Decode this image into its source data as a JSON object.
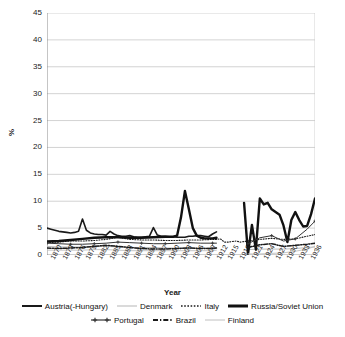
{
  "chart_data": {
    "type": "line",
    "title": "",
    "xlabel": "Year",
    "ylabel": "%",
    "ylim": [
      0,
      45
    ],
    "yticks": [
      0,
      5,
      10,
      15,
      20,
      25,
      30,
      35,
      40,
      45
    ],
    "xlim": [
      1870,
      1938
    ],
    "xticks": [
      1870,
      1873,
      1876,
      1879,
      1882,
      1885,
      1888,
      1891,
      1894,
      1897,
      1900,
      1903,
      1906,
      1909,
      1912,
      1915,
      1918,
      1921,
      1924,
      1927,
      1930,
      1933,
      1936
    ],
    "grid": "horizontal",
    "legend_position": "bottom",
    "series": [
      {
        "name": "Austria(-Hungary)",
        "style": "solid",
        "color": "#1a1a1a",
        "width": 1.6,
        "x": [
          1870,
          1871,
          1872,
          1873,
          1874,
          1875,
          1876,
          1877,
          1878,
          1879,
          1880,
          1881,
          1882,
          1883,
          1884,
          1885,
          1886,
          1887,
          1888,
          1889,
          1890,
          1891,
          1892,
          1893,
          1894,
          1895,
          1896,
          1897,
          1898,
          1899,
          1900,
          1901,
          1902,
          1903,
          1904,
          1905,
          1906,
          1907,
          1908,
          1909,
          1910,
          1911,
          1912,
          1913
        ],
        "values": [
          5.0,
          4.8,
          4.6,
          4.4,
          4.3,
          4.2,
          4.1,
          4.2,
          4.4,
          6.7,
          4.6,
          4.1,
          3.9,
          3.8,
          3.8,
          3.7,
          4.4,
          3.9,
          3.6,
          3.5,
          3.5,
          3.6,
          3.4,
          3.3,
          3.3,
          3.4,
          3.5,
          5.1,
          3.7,
          3.5,
          3.5,
          3.4,
          3.4,
          3.3,
          3.3,
          3.3,
          3.5,
          3.5,
          3.6,
          3.6,
          3.5,
          3.4,
          3.9,
          4.3
        ]
      },
      {
        "name": "Denmark",
        "style": "solid",
        "color": "#b5b5b5",
        "width": 0.9,
        "x": [
          1870,
          1873,
          1876,
          1879,
          1882,
          1885,
          1888,
          1891,
          1894,
          1897,
          1900,
          1903,
          1906,
          1909,
          1912,
          1913,
          1921,
          1924,
          1927,
          1930,
          1933,
          1936,
          1938
        ],
        "values": [
          1.6,
          1.5,
          1.5,
          1.5,
          1.6,
          1.6,
          1.5,
          1.4,
          1.4,
          1.4,
          1.3,
          1.3,
          1.3,
          1.3,
          1.3,
          1.4,
          1.0,
          1.1,
          1.1,
          1.1,
          1.2,
          1.4,
          1.5
        ]
      },
      {
        "name": "Italy",
        "style": "dotted",
        "color": "#1a1a1a",
        "width": 1.1,
        "x": [
          1870,
          1873,
          1876,
          1879,
          1882,
          1885,
          1888,
          1891,
          1894,
          1897,
          1900,
          1903,
          1906,
          1909,
          1912,
          1913,
          1914,
          1915,
          1916,
          1917,
          1918,
          1919,
          1921,
          1924,
          1927,
          1930,
          1933,
          1936,
          1938
        ],
        "values": [
          2.3,
          2.4,
          2.6,
          2.6,
          2.7,
          2.9,
          3.3,
          2.9,
          2.8,
          2.8,
          2.7,
          2.7,
          2.8,
          2.8,
          2.9,
          2.9,
          3.0,
          2.4,
          2.4,
          2.5,
          2.6,
          2.4,
          2.6,
          2.9,
          3.1,
          2.9,
          3.0,
          3.5,
          3.8
        ]
      },
      {
        "name": "Russia/Soviet Union",
        "style": "solid",
        "color": "#111111",
        "width": 2.4,
        "x": [
          1870,
          1873,
          1876,
          1879,
          1882,
          1885,
          1888,
          1891,
          1894,
          1897,
          1900,
          1902,
          1903,
          1904,
          1905,
          1906,
          1907,
          1908,
          1909,
          1910,
          1912,
          1913,
          1920,
          1921,
          1922,
          1923,
          1924,
          1925,
          1926,
          1927,
          1928,
          1929,
          1930,
          1931,
          1932,
          1933,
          1934,
          1935,
          1936,
          1937,
          1938
        ],
        "values": [
          2.5,
          2.6,
          2.8,
          3.0,
          3.2,
          3.3,
          3.3,
          3.2,
          3.2,
          3.3,
          3.4,
          3.4,
          3.6,
          7.0,
          11.9,
          8.5,
          5.0,
          3.6,
          3.2,
          3.1,
          3.1,
          3.2,
          9.7,
          0.2,
          5.6,
          1.0,
          10.5,
          9.4,
          9.7,
          8.5,
          8.0,
          7.5,
          5.5,
          2.4,
          6.5,
          8.0,
          6.5,
          5.3,
          5.4,
          7.6,
          10.5
        ]
      },
      {
        "name": "Portugal",
        "style": "solid-marker",
        "color": "#333333",
        "width": 1.0,
        "x": [
          1870,
          1873,
          1876,
          1879,
          1882,
          1885,
          1888,
          1891,
          1894,
          1897,
          1900,
          1903,
          1906,
          1909,
          1912,
          1913,
          1921,
          1924,
          1927,
          1930,
          1933,
          1936,
          1938
        ],
        "values": [
          2.2,
          2.1,
          2.0,
          2.0,
          2.1,
          2.2,
          2.4,
          2.3,
          2.2,
          2.1,
          2.1,
          2.2,
          2.3,
          2.2,
          2.2,
          2.2,
          2.1,
          3.2,
          3.6,
          2.6,
          3.0,
          4.8,
          6.3
        ]
      },
      {
        "name": "Brazil",
        "style": "dashdot",
        "color": "#1a1a1a",
        "width": 1.5,
        "x": [
          1870,
          1873,
          1876,
          1879,
          1882,
          1885,
          1888,
          1891,
          1894,
          1897,
          1900,
          1903,
          1906,
          1909,
          1912,
          1913,
          1921,
          1924,
          1927,
          1930,
          1933,
          1936,
          1938
        ],
        "values": [
          1.3,
          1.2,
          1.3,
          1.4,
          1.6,
          1.8,
          1.6,
          1.4,
          1.2,
          1.1,
          1.1,
          1.2,
          1.3,
          1.2,
          1.2,
          1.3,
          1.4,
          1.9,
          2.1,
          1.6,
          1.8,
          2.0,
          2.2
        ]
      },
      {
        "name": "Finland",
        "style": "solid",
        "color": "#c0c0c0",
        "width": 0.9,
        "x": [
          1870,
          1873,
          1876,
          1879,
          1882,
          1885,
          1888,
          1891,
          1894,
          1897,
          1900,
          1903,
          1906,
          1909,
          1912,
          1913,
          1921,
          1924,
          1927,
          1930,
          1933,
          1936,
          1938
        ],
        "values": [
          0.9,
          0.9,
          0.9,
          0.9,
          1.0,
          1.0,
          0.9,
          0.8,
          0.8,
          0.8,
          0.8,
          0.8,
          0.8,
          0.8,
          0.8,
          0.9,
          0.2,
          0.2,
          0.3,
          0.4,
          0.7,
          1.1,
          1.6
        ]
      }
    ]
  },
  "axes": {
    "y_title": "%",
    "x_title": "Year"
  },
  "legend": {
    "row1": [
      {
        "label": "Austria(-Hungary)",
        "style": "solid-thick",
        "color": "#1a1a1a"
      },
      {
        "label": "Denmark",
        "style": "solid-thin-gray",
        "color": "#b5b5b5"
      },
      {
        "label": "Italy",
        "style": "dotted",
        "color": "#1a1a1a"
      },
      {
        "label": "Russia/Soviet Union",
        "style": "solid-extra-thick",
        "color": "#111111"
      }
    ],
    "row2": [
      {
        "label": "Portugal",
        "style": "marker-cross",
        "color": "#333333"
      },
      {
        "label": "Brazil",
        "style": "dashdot",
        "color": "#1a1a1a"
      },
      {
        "label": "Finland",
        "style": "solid-thin-gray",
        "color": "#c0c0c0"
      }
    ]
  },
  "colors": {
    "grid": "#c8c8c8",
    "axis": "#808080",
    "text": "#1a1a1a",
    "background": "#ffffff"
  }
}
